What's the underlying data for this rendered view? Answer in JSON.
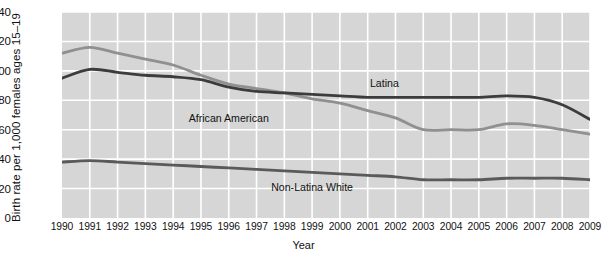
{
  "chart_data": {
    "type": "line",
    "title": "",
    "xlabel": "Year",
    "ylabel": "Birth rate per 1,000 females ages 15–19",
    "x": [
      1990,
      1991,
      1992,
      1993,
      1994,
      1995,
      1996,
      1997,
      1998,
      1999,
      2000,
      2001,
      2002,
      2003,
      2004,
      2005,
      2006,
      2007,
      2008,
      2009
    ],
    "xlim": [
      1990,
      2009
    ],
    "ylim": [
      0,
      140
    ],
    "yticks": [
      0,
      20,
      40,
      60,
      80,
      100,
      120,
      140
    ],
    "xticks": [
      "1990",
      "1991",
      "1992",
      "1993",
      "1994",
      "1995",
      "1996",
      "1997",
      "1998",
      "1999",
      "2000",
      "2001",
      "2002",
      "2003",
      "2004",
      "2005",
      "2006",
      "2007",
      "2008",
      "2009"
    ],
    "grid": true,
    "legend_position": "inline-labels",
    "series": [
      {
        "name": "African American",
        "color": "#909090",
        "label_x": 1996.0,
        "label_y": 68,
        "values": [
          112,
          116,
          112,
          108,
          104,
          97,
          91,
          88,
          85,
          81,
          78,
          73,
          68,
          60,
          60,
          60,
          64,
          63,
          60,
          57
        ]
      },
      {
        "name": "Latina",
        "color": "#3c3c3c",
        "label_x": 2001.6,
        "label_y": 92,
        "values": [
          95,
          101,
          99,
          97,
          96,
          94,
          89,
          86,
          85,
          84,
          83,
          82,
          82,
          82,
          82,
          82,
          83,
          82,
          77,
          67
        ]
      },
      {
        "name": "Non-Latina White",
        "color": "#5a5a5a",
        "label_x": 1999.0,
        "label_y": 21,
        "values": [
          38,
          39,
          38,
          37,
          36,
          35,
          34,
          33,
          32,
          31,
          30,
          29,
          28,
          26,
          26,
          26,
          27,
          27,
          27,
          26
        ]
      }
    ]
  }
}
